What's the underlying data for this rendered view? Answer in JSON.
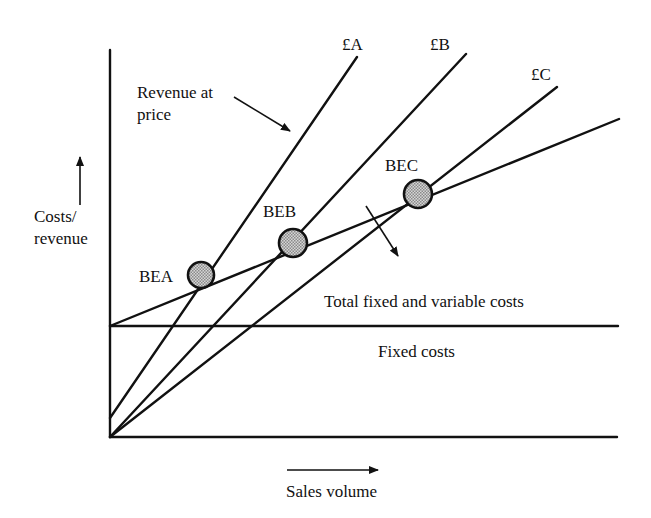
{
  "diagram": {
    "type": "break-even chart",
    "axes": {
      "y_label_line1": "Costs/",
      "y_label_line2": "revenue",
      "x_label": "Sales volume"
    },
    "revenue_annotation": {
      "line1": "Revenue at",
      "line2": "price"
    },
    "revenue_lines": [
      {
        "label": "£A"
      },
      {
        "label": "£B"
      },
      {
        "label": "£C"
      }
    ],
    "break_even_points": [
      {
        "label": "BEA"
      },
      {
        "label": "BEB"
      },
      {
        "label": "BEC"
      }
    ],
    "cost_lines": {
      "total": "Total fixed and variable costs",
      "fixed": "Fixed costs"
    },
    "colors": {
      "ink": "#111111",
      "point_fill": "#b8b8b8",
      "background": "#ffffff"
    }
  }
}
